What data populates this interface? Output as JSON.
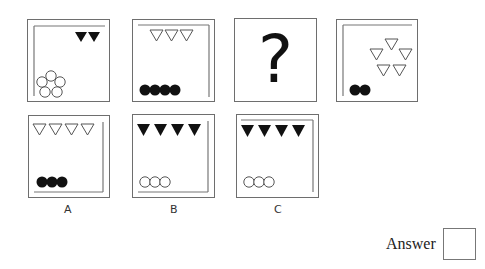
{
  "puzzle": {
    "sequence": [
      {
        "id": "frame-1",
        "lines": "top-left",
        "triangles": {
          "count": 2,
          "fill": "black",
          "layout": "row-top-right"
        },
        "circles": {
          "count": 5,
          "fill": "white",
          "layout": "pentagon-bottom-left"
        }
      },
      {
        "id": "frame-2",
        "lines": "top-right",
        "triangles": {
          "count": 3,
          "fill": "white",
          "layout": "row-top"
        },
        "circles": {
          "count": 4,
          "fill": "black",
          "layout": "row-bottom-left"
        }
      },
      {
        "id": "frame-3",
        "placeholder": "?"
      },
      {
        "id": "frame-4",
        "lines": "top-left",
        "triangles": {
          "count": 5,
          "fill": "white",
          "layout": "cluster-top-right"
        },
        "circles": {
          "count": 2,
          "fill": "black",
          "layout": "row-bottom-left"
        }
      }
    ],
    "options": [
      {
        "label": "A",
        "lines": "right-bottom",
        "triangles": {
          "count": 4,
          "fill": "white"
        },
        "circles": {
          "count": 3,
          "fill": "black"
        }
      },
      {
        "label": "B",
        "lines": "right-bottom",
        "triangles": {
          "count": 4,
          "fill": "black"
        },
        "circles": {
          "count": 3,
          "fill": "white"
        }
      },
      {
        "label": "C",
        "lines": "top-right",
        "triangles": {
          "count": 4,
          "fill": "black"
        },
        "circles": {
          "count": 3,
          "fill": "white"
        }
      }
    ],
    "question_mark": "?",
    "answer_label": "Answer"
  }
}
